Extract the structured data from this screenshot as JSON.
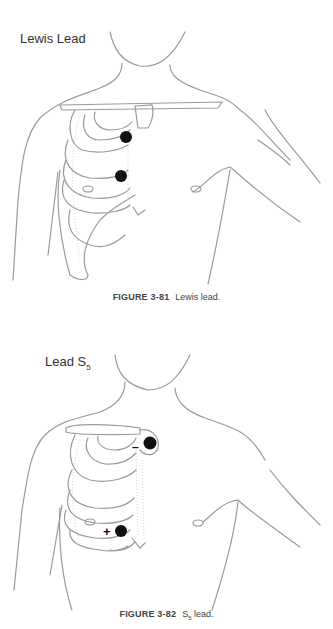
{
  "figures": [
    {
      "label": "Lewis Lead",
      "caption_number": "FIGURE 3-81",
      "caption_text": "Lewis lead.",
      "electrodes": [
        {
          "position": "right sternal border, 2nd intercostal space",
          "sign": ""
        },
        {
          "position": "right sternal border, 4th intercostal space",
          "sign": ""
        }
      ]
    },
    {
      "label_main": "Lead S",
      "label_sub": "5",
      "caption_number": "FIGURE 3-82",
      "caption_text_main": "S",
      "caption_text_sub": "5",
      "caption_text_rest": " lead.",
      "electrodes": [
        {
          "position": "manubrium",
          "sign": "–"
        },
        {
          "position": "right sternal border, 5th intercostal space",
          "sign": "+"
        }
      ]
    }
  ],
  "colors": {
    "line": "#9a9a9a",
    "electrode": "#111111",
    "text": "#333333"
  }
}
